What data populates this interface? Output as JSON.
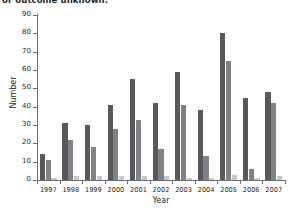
{
  "clipped_heading": "or outcome unknown.",
  "axes": {
    "ylabel": "Number",
    "xlabel": "Year",
    "y_ticks": [
      "0",
      "10",
      "20",
      "30",
      "40",
      "50",
      "60",
      "70",
      "80",
      "90"
    ],
    "x_ticks": [
      "1997",
      "1998",
      "1999",
      "2000",
      "2001",
      "2002",
      "2003",
      "2004",
      "2005",
      "2006",
      "2007"
    ]
  },
  "colors": {
    "series_1": "#58595b",
    "series_2": "#808285",
    "series_3": "#c7c8ca",
    "axis": "#6d6e71",
    "text": "#231f20",
    "background": "#ffffff"
  },
  "chart_data": {
    "type": "bar",
    "title": "",
    "xlabel": "Year",
    "ylabel": "Number",
    "ylim": [
      0,
      90
    ],
    "ytick_step": 10,
    "grid": false,
    "legend": "none",
    "categories": [
      "1997",
      "1998",
      "1999",
      "2000",
      "2001",
      "2002",
      "2003",
      "2004",
      "2005",
      "2006",
      "2007"
    ],
    "series": [
      {
        "name": "series-1",
        "color": "#58595b",
        "values": [
          14,
          31,
          30,
          41,
          55,
          42,
          59,
          38,
          80,
          45,
          48
        ]
      },
      {
        "name": "series-2",
        "color": "#808285",
        "values": [
          11,
          22,
          18,
          28,
          33,
          17,
          41,
          13,
          65,
          6,
          42
        ]
      },
      {
        "name": "series-3",
        "color": "#c7c8ca",
        "values": [
          1,
          2,
          2,
          2,
          2,
          2,
          1,
          1,
          3,
          1,
          2
        ]
      }
    ]
  }
}
